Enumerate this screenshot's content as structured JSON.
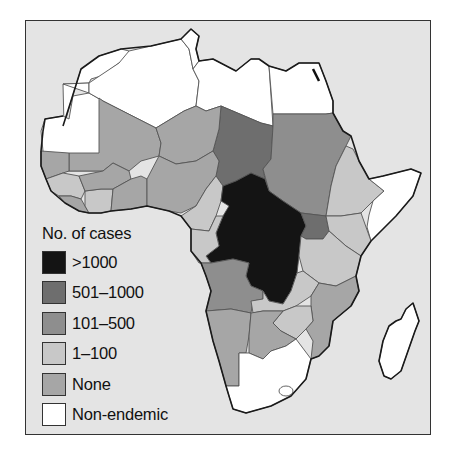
{
  "legend": {
    "title": "No. of cases",
    "items": [
      {
        "label": ">1000",
        "color": "#141414"
      },
      {
        "label": "501–1000",
        "color": "#6e6e6e"
      },
      {
        "label": "101–500",
        "color": "#8e8e8e"
      },
      {
        "label": "1–100",
        "color": "#c8c8c8"
      },
      {
        "label": "None",
        "color": "#a6a6a6"
      },
      {
        "label": "Non-endemic",
        "color": "#ffffff"
      }
    ]
  },
  "map": {
    "region": "Africa",
    "background_color": "#e4e4e4",
    "categories": {
      ">1000": [
        "Democratic Republic of the Congo",
        "Central African Republic"
      ],
      "501–1000": [
        "Chad",
        "Uganda"
      ],
      "101–500": [
        "Sudan",
        "Angola"
      ],
      "1–100": [
        "Cameroon",
        "Gabon",
        "Congo",
        "Zambia",
        "Zimbabwe",
        "Ethiopia",
        "Kenya",
        "Tanzania",
        "Malawi",
        "Ivory Coast",
        "Guinea"
      ],
      "None": [
        "Mali",
        "Niger",
        "Nigeria",
        "Burkina Faso",
        "Senegal",
        "Namibia",
        "Botswana",
        "Mozambique"
      ],
      "Non-endemic": [
        "Morocco",
        "Western Sahara",
        "Mauritania",
        "Algeria",
        "Tunisia",
        "Libya",
        "Egypt",
        "Somalia",
        "South Africa",
        "Madagascar"
      ]
    }
  }
}
